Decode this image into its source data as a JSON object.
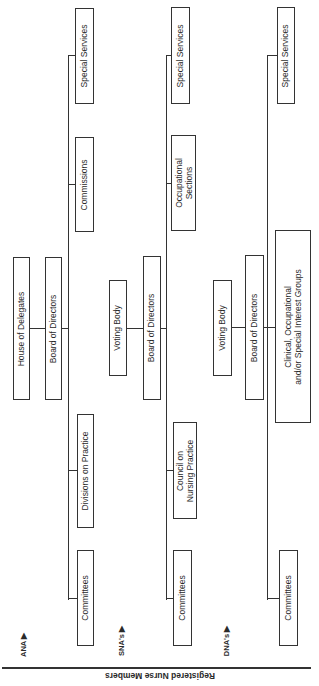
{
  "diagram": {
    "footer_label": "Registered Nurse Members",
    "levels": [
      {
        "tag": "ANA ▶",
        "governance": [
          "House of Delegates",
          "Board of Directors"
        ],
        "units": [
          "Special Services",
          "Commissions",
          "Divisions on Practice",
          "Committees"
        ]
      },
      {
        "tag": "SNA's ▶",
        "governance": [
          "Voting Body",
          "Board of Directors"
        ],
        "units": [
          "Special Services",
          "Occupational\nSections",
          "Council on\nNursing Practice",
          "Committees"
        ]
      },
      {
        "tag": "DNA's ▶",
        "governance": [
          "Voting Body",
          "Board of Directors"
        ],
        "units": [
          "Special Services",
          "Clinical, Occupational\nand/or Special Interest Groups",
          "Committees"
        ]
      }
    ]
  }
}
